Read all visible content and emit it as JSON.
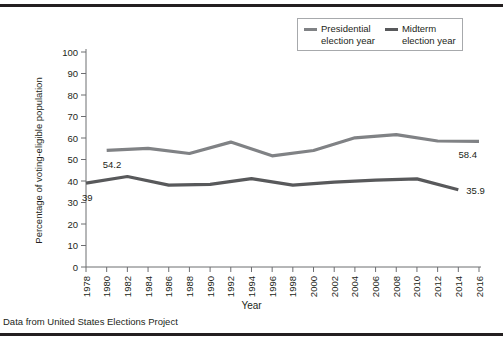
{
  "page": {
    "cutoff_header": "",
    "footnote": "Data from United States Elections Project"
  },
  "legend": {
    "entries": [
      {
        "name": "presidential",
        "line1": "Presidential",
        "line2": "election year",
        "color": "#808285"
      },
      {
        "name": "midterm",
        "line1": "Midterm",
        "line2": "election year",
        "color": "#58595b"
      }
    ]
  },
  "axes": {
    "y_title": "Percentage of voting-eligible population",
    "x_title": "Year"
  },
  "annotations": {
    "presidential_start": "54.2",
    "presidential_end": "58.4",
    "midterm_start": "39",
    "midterm_end": "35.9"
  },
  "chart_data": {
    "type": "line",
    "title": "",
    "xlabel": "Year",
    "ylabel": "Percentage of voting-eligible population",
    "xlim": [
      1978,
      2016
    ],
    "ylim": [
      0,
      100
    ],
    "ytick_step": 10,
    "yticks": [
      0,
      10,
      20,
      30,
      40,
      50,
      60,
      70,
      80,
      90,
      100
    ],
    "xticks": [
      1978,
      1980,
      1982,
      1984,
      1986,
      1988,
      1990,
      1992,
      1994,
      1996,
      1998,
      2000,
      2002,
      2004,
      2006,
      2008,
      2010,
      2012,
      2014,
      2016
    ],
    "grid": false,
    "legend_position": "top-right",
    "series": [
      {
        "name": "Presidential election year",
        "color": "#808285",
        "x": [
          1980,
          1984,
          1988,
          1992,
          1996,
          2000,
          2004,
          2008,
          2012,
          2016
        ],
        "values": [
          54.2,
          55.2,
          52.8,
          58.1,
          51.7,
          54.2,
          60.1,
          61.6,
          58.6,
          58.4
        ],
        "labels": {
          "first": "54.2",
          "last": "58.4"
        }
      },
      {
        "name": "Midterm election year",
        "color": "#58595b",
        "x": [
          1978,
          1982,
          1986,
          1990,
          1994,
          1998,
          2002,
          2006,
          2010,
          2014
        ],
        "values": [
          39.0,
          42.1,
          38.1,
          38.4,
          41.1,
          38.1,
          39.5,
          40.4,
          41.0,
          35.9
        ],
        "labels": {
          "first": "39",
          "last": "35.9"
        }
      }
    ]
  }
}
